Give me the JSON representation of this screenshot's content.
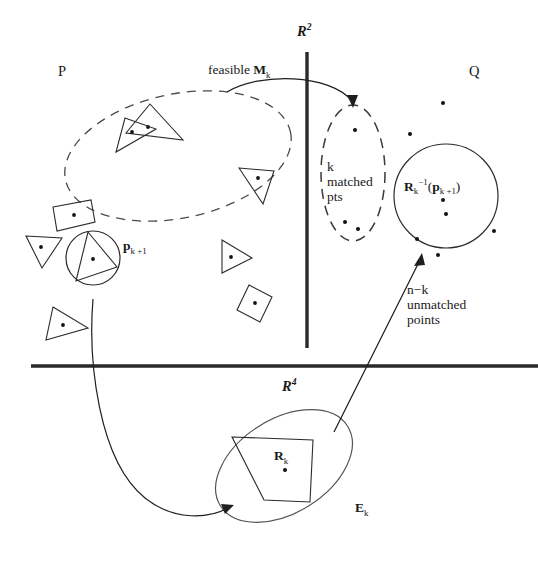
{
  "figure": {
    "type": "geometric-pattern-matching-diagram",
    "title_present": false,
    "regions": {
      "pattern_label": "P",
      "scene_label": "Q",
      "transform_space_top": "R",
      "transform_space_top_sup": "2",
      "transform_space_bottom": "R",
      "transform_space_bottom_sup": "4"
    },
    "annotations": {
      "feasible": "feasible",
      "feasible_symbol": "M",
      "feasible_symbol_sub": "k",
      "matched_count": "k",
      "matched_line1": "matched",
      "matched_line2": "pts",
      "unmatched_count_a": "n",
      "unmatched_count_minus": "−",
      "unmatched_count_b": "k",
      "unmatched_line1": "unmatched",
      "unmatched_line2": "points",
      "point_p": "p",
      "point_p_sub": "k +1",
      "inverse_R": "R",
      "inverse_R_sub": "k",
      "inverse_R_sup": "−1",
      "inverse_arg_open": "(",
      "inverse_arg_p": "p",
      "inverse_arg_sub": "k +1",
      "inverse_arg_close": ")",
      "transform_R": "R",
      "transform_R_sub": "k",
      "ellipse_E": "E",
      "ellipse_E_sub": "k"
    },
    "colors": {
      "ink": "#161616",
      "background": "#ffffff",
      "thick_rule": "#2a2a2a",
      "dashed_stroke": "#4a4a4a",
      "thin_stroke": "#2b2b2b"
    },
    "geometry": {
      "vertical_divider": {
        "x": 307,
        "y1": 52,
        "y2": 348,
        "width": 3.2
      },
      "horizontal_divider": {
        "x1": 31,
        "x2": 538,
        "y": 366,
        "width": 3.2
      },
      "dashed_ellipse_P": {
        "cx": 178,
        "cy": 156,
        "rx": 115,
        "ry": 62,
        "rotation": -12
      },
      "dashed_ellipse_matched": {
        "cx": 353,
        "cy": 173,
        "rx": 32,
        "ry": 68,
        "rotation": 0
      },
      "solid_circle_Q": {
        "cx": 446,
        "cy": 196,
        "r": 52
      },
      "solid_circle_p": {
        "cx": 93,
        "cy": 258,
        "r": 27
      },
      "ellipse_Ek": {
        "cx": 284,
        "cy": 466,
        "rx": 74,
        "ry": 47,
        "rotation": -32
      }
    },
    "shape_counts": {
      "pattern_triangles": 6,
      "pattern_quads": 3,
      "scene_points_visible": 12
    }
  }
}
